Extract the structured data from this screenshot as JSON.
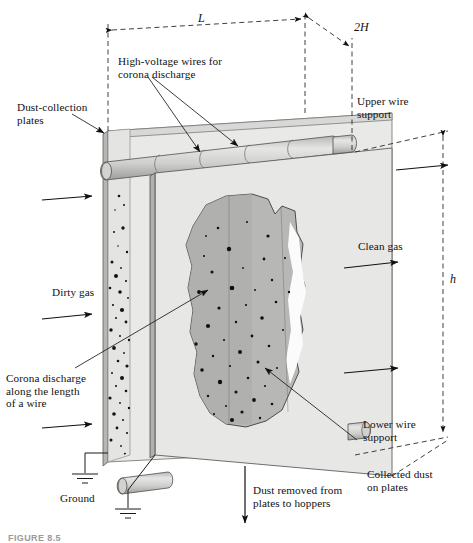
{
  "figure": {
    "caption": "FIGURE 8.5"
  },
  "dimensions": [
    {
      "id": "length",
      "label": "L",
      "description": "plate length along gas flow"
    },
    {
      "id": "wire-spacing",
      "label": "2H",
      "description": "plate-to-plate spacing"
    },
    {
      "id": "height",
      "label": "h",
      "description": "plate height"
    }
  ],
  "labels": {
    "dust_collection_plates": "Dust-collection\nplates",
    "high_voltage_wires": "High-voltage wires for\ncorona discharge",
    "upper_wire_support": "Upper wire\nsupport",
    "lower_wire_support": "Lower wire\nsupport",
    "clean_gas": "Clean gas",
    "dirty_gas": "Dirty gas",
    "corona_discharge": "Corona discharge\nalong the length\nof a wire",
    "collected_dust": "Collected dust\non plates",
    "ground": "Ground",
    "dust_removed": "Dust removed from\nplates to hoppers"
  },
  "colors": {
    "plate_face": "#e8e8e6",
    "plate_front": "#e3e3e1",
    "plate_edge": "#a8a8a6",
    "dust_blob": "#b9b9b7",
    "dust_blob_dark": "#a9a9a7",
    "wire_fill": "#cccccb",
    "line": "#1a1a1a",
    "dash": "#2a2a2a",
    "particle": "#111111"
  },
  "icons": {
    "ground_upper": "ground-symbol-icon",
    "ground_lower": "ground-symbol-icon",
    "flow_arrow_inlet": "arrow-right-icon",
    "flow_arrow_outlet": "arrow-right-icon",
    "hopper_arrow": "arrow-down-icon"
  }
}
